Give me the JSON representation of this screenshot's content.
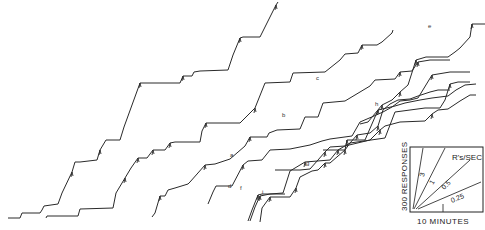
{
  "chart_data": {
    "type": "line",
    "title": "",
    "subtitle": "Cumulative response records",
    "xlabel": "10 MINUTES",
    "ylabel": "300 RESPONSES",
    "grid": false,
    "legend": {
      "position": "bottom-right",
      "title": "R's/SEC",
      "rates": [
        "3",
        "1",
        "0.5",
        "0.25"
      ],
      "x_scale_label": "10 MINUTES",
      "y_scale_label": "300 RESPONSES"
    },
    "series": [
      {
        "name": "record-1",
        "label": "",
        "points": [
          [
            8,
            218
          ],
          [
            20,
            218
          ],
          [
            22,
            213
          ],
          [
            40,
            213
          ],
          [
            42,
            210
          ],
          [
            44,
            206
          ],
          [
            58,
            204
          ],
          [
            62,
            193
          ],
          [
            72,
            172
          ],
          [
            75,
            162
          ],
          [
            80,
            162
          ],
          [
            97,
            160
          ],
          [
            100,
            150
          ],
          [
            106,
            140
          ],
          [
            120,
            140
          ],
          [
            124,
            127
          ],
          [
            140,
            83
          ],
          [
            180,
            83
          ],
          [
            183,
            76
          ],
          [
            192,
            76
          ],
          [
            194,
            72
          ],
          [
            200,
            71
          ],
          [
            228,
            70
          ],
          [
            233,
            55
          ],
          [
            240,
            38
          ],
          [
            243,
            37
          ],
          [
            260,
            37
          ],
          [
            266,
            25
          ],
          [
            276,
            5
          ],
          [
            278,
            2
          ]
        ]
      },
      {
        "name": "record-2",
        "label": "a",
        "points": [
          [
            46,
            218
          ],
          [
            47,
            216
          ],
          [
            78,
            216
          ],
          [
            80,
            209
          ],
          [
            113,
            208
          ],
          [
            116,
            193
          ],
          [
            125,
            178
          ],
          [
            131,
            168
          ],
          [
            138,
            158
          ],
          [
            147,
            158
          ],
          [
            153,
            150
          ],
          [
            165,
            150
          ],
          [
            170,
            143
          ],
          [
            175,
            142
          ],
          [
            200,
            142
          ],
          [
            202,
            131
          ],
          [
            206,
            123
          ],
          [
            240,
            123
          ],
          [
            255,
            108
          ],
          [
            265,
            83
          ],
          [
            290,
            82
          ],
          [
            293,
            73
          ],
          [
            325,
            72
          ],
          [
            340,
            60
          ],
          [
            345,
            54
          ],
          [
            358,
            53
          ],
          [
            362,
            45
          ],
          [
            377,
            45
          ],
          [
            382,
            42
          ],
          [
            392,
            33
          ],
          [
            393,
            30
          ]
        ]
      },
      {
        "name": "record-3",
        "label": "b",
        "points": [
          [
            152,
            217
          ],
          [
            155,
            213
          ],
          [
            160,
            196
          ],
          [
            165,
            196
          ],
          [
            168,
            190
          ],
          [
            175,
            188
          ],
          [
            188,
            184
          ],
          [
            190,
            182
          ],
          [
            205,
            165
          ],
          [
            215,
            164
          ],
          [
            230,
            159
          ],
          [
            245,
            146
          ],
          [
            250,
            137
          ],
          [
            267,
            137
          ],
          [
            269,
            133
          ],
          [
            277,
            130
          ],
          [
            300,
            129
          ],
          [
            305,
            117
          ],
          [
            318,
            117
          ],
          [
            323,
            103
          ],
          [
            345,
            101
          ],
          [
            370,
            86
          ],
          [
            375,
            80
          ],
          [
            395,
            79
          ],
          [
            400,
            72
          ],
          [
            412,
            71
          ],
          [
            418,
            62
          ],
          [
            430,
            60
          ],
          [
            450,
            60
          ]
        ]
      },
      {
        "name": "record-4",
        "label": "c",
        "points": [
          [
            250,
            221
          ],
          [
            255,
            207
          ],
          [
            260,
            196
          ],
          [
            270,
            194
          ],
          [
            283,
            193
          ],
          [
            290,
            171
          ],
          [
            305,
            162
          ],
          [
            330,
            160
          ],
          [
            338,
            150
          ],
          [
            350,
            143
          ],
          [
            385,
            138
          ],
          [
            395,
            112
          ],
          [
            410,
            110
          ],
          [
            425,
            108
          ],
          [
            440,
            108
          ],
          [
            445,
            100
          ],
          [
            450,
            84
          ],
          [
            458,
            82
          ],
          [
            470,
            82
          ]
        ]
      },
      {
        "name": "record-5",
        "label": "d",
        "points": [
          [
            208,
            204
          ],
          [
            213,
            192
          ],
          [
            216,
            186
          ],
          [
            232,
            186
          ],
          [
            243,
            165
          ],
          [
            248,
            161
          ],
          [
            262,
            160
          ],
          [
            270,
            150
          ],
          [
            290,
            149
          ],
          [
            310,
            145
          ],
          [
            322,
            141
          ],
          [
            330,
            139
          ],
          [
            352,
            136
          ],
          [
            360,
            122
          ],
          [
            374,
            116
          ],
          [
            383,
            112
          ],
          [
            392,
            107
          ],
          [
            400,
            101
          ],
          [
            410,
            100
          ],
          [
            418,
            98
          ],
          [
            432,
            75
          ],
          [
            450,
            72
          ],
          [
            470,
            72
          ]
        ]
      },
      {
        "name": "record-6",
        "label": "e",
        "points": [
          [
            360,
            124
          ],
          [
            368,
            122
          ],
          [
            382,
            105
          ],
          [
            392,
            100
          ],
          [
            400,
            92
          ],
          [
            408,
            85
          ],
          [
            416,
            60
          ],
          [
            426,
            57
          ],
          [
            448,
            57
          ],
          [
            455,
            52
          ],
          [
            460,
            48
          ],
          [
            470,
            37
          ],
          [
            472,
            24
          ],
          [
            478,
            24
          ],
          [
            485,
            24
          ]
        ]
      },
      {
        "name": "record-7",
        "label": "f",
        "points": [
          [
            248,
            221
          ],
          [
            252,
            210
          ],
          [
            258,
            195
          ],
          [
            262,
            194
          ],
          [
            285,
            194
          ]
        ]
      },
      {
        "name": "record-8",
        "label": "g",
        "points": [
          [
            275,
            170
          ],
          [
            300,
            170
          ],
          [
            310,
            169
          ],
          [
            318,
            160
          ],
          [
            325,
            152
          ],
          [
            330,
            147
          ],
          [
            345,
            146
          ],
          [
            370,
            140
          ],
          [
            380,
            130
          ],
          [
            385,
            126
          ],
          [
            400,
            122
          ],
          [
            425,
            121
          ],
          [
            432,
            114
          ],
          [
            438,
            110
          ],
          [
            448,
            109
          ],
          [
            460,
            101
          ],
          [
            465,
            98
          ],
          [
            470,
            95
          ],
          [
            476,
            95
          ]
        ]
      },
      {
        "name": "record-9",
        "label": "h",
        "points": [
          [
            323,
            150
          ],
          [
            345,
            150
          ],
          [
            347,
            140
          ],
          [
            365,
            140
          ],
          [
            378,
            110
          ],
          [
            395,
            106
          ],
          [
            405,
            103
          ],
          [
            420,
            100
          ],
          [
            432,
            98
          ],
          [
            440,
            97
          ],
          [
            448,
            96
          ],
          [
            456,
            90
          ],
          [
            465,
            85
          ],
          [
            476,
            84
          ]
        ]
      },
      {
        "name": "record-10",
        "label": "i",
        "points": [
          [
            260,
            222
          ],
          [
            262,
            208
          ],
          [
            270,
            197
          ],
          [
            290,
            197
          ],
          [
            296,
            188
          ],
          [
            300,
            177
          ],
          [
            312,
            171
          ],
          [
            318,
            170
          ],
          [
            325,
            163
          ],
          [
            330,
            163
          ],
          [
            345,
            150
          ],
          [
            350,
            143
          ],
          [
            357,
            135
          ],
          [
            370,
            133
          ],
          [
            378,
            126
          ],
          [
            383,
            110
          ],
          [
            390,
            104
          ],
          [
            398,
            100
          ],
          [
            410,
            99
          ],
          [
            418,
            96
          ],
          [
            424,
            94
          ],
          [
            430,
            92
          ],
          [
            438,
            90
          ],
          [
            450,
            90
          ]
        ]
      }
    ],
    "labels": [
      {
        "text": "a",
        "x": 230,
        "y": 157
      },
      {
        "text": "b",
        "x": 282,
        "y": 117
      },
      {
        "text": "c",
        "x": 316,
        "y": 80
      },
      {
        "text": "d",
        "x": 228,
        "y": 188
      },
      {
        "text": "e",
        "x": 428,
        "y": 28
      },
      {
        "text": "f",
        "x": 240,
        "y": 190
      },
      {
        "text": "g",
        "x": 306,
        "y": 165
      },
      {
        "text": "h",
        "x": 375,
        "y": 106
      },
      {
        "text": "i",
        "x": 262,
        "y": 194
      }
    ]
  }
}
